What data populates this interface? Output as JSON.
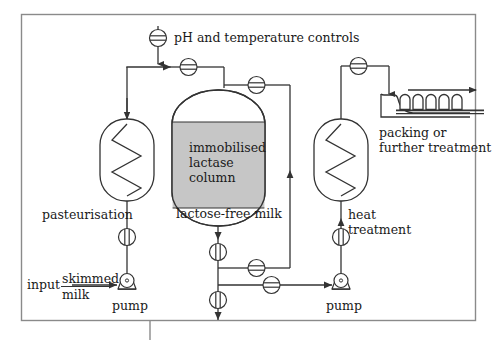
{
  "figure": {
    "type": "process-flow-diagram",
    "background_color": "#ffffff",
    "line_color": "#333333",
    "fill_gray": "#c6c6c6",
    "border_color": "#888888"
  },
  "labels": {
    "ph_temperature_controls": "pH and temperature controls",
    "immobilised_lactase_column_line1": "immobilised",
    "immobilised_lactase_column_line2": "lactase",
    "immobilised_lactase_column_line3": "column",
    "lactose_free_milk": "lactose-free milk",
    "pasteurisation": "pasteurisation",
    "heat_treatment_line1": "heat",
    "heat_treatment_line2": "treatment",
    "packing_line1": "packing or",
    "packing_line2": "further treatment",
    "input": "input",
    "skimmed": "skimmed",
    "milk": "milk",
    "pump_left": "pump",
    "pump_right": "pump"
  },
  "components": [
    {
      "name": "pasteurisation-heat-exchanger",
      "kind": "heat-exchanger",
      "label": "pasteurisation"
    },
    {
      "name": "immobilised-lactase-column",
      "kind": "column",
      "label": "immobilised lactase column"
    },
    {
      "name": "heat-treatment-heat-exchanger",
      "kind": "heat-exchanger",
      "label": "heat treatment"
    },
    {
      "name": "packing-station",
      "kind": "filler-conveyor",
      "label": "packing or further treatment"
    },
    {
      "name": "pump-left",
      "kind": "pump",
      "label": "pump"
    },
    {
      "name": "pump-right",
      "kind": "pump",
      "label": "pump"
    }
  ],
  "valves": {
    "horizontal_style": "circle-with-horizontal-bar",
    "vertical_style": "circle-with-vertical-bar",
    "count_horizontal": 6,
    "count_vertical": 4,
    "total": 10
  },
  "packing": {
    "bottle_count": 5,
    "conveyor_direction": "right"
  },
  "flow": {
    "inlet_stream": "skimmed milk",
    "product_stream": "lactose-free milk",
    "recycle": true
  }
}
